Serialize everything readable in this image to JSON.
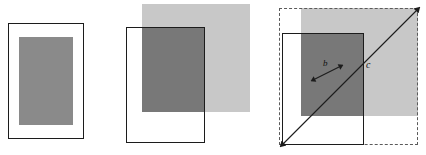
{
  "figure": {
    "title": "",
    "background_color": "#ffffff",
    "panel_count": 3
  },
  "colors": {
    "outline": "#1c1c1c",
    "mid_gray": "#8a8a8a",
    "light_gray": "#c8c8c8",
    "dark_overlap_gray": "#787878",
    "dashed_border": "#5a5a5a",
    "arrow": "#1c1c1c",
    "label_text": "#111111",
    "background": "#ffffff"
  },
  "panels": [
    {
      "id": "panel-a",
      "name": "panel-left",
      "shapes": [
        {
          "name": "outer-rectangle-a",
          "kind": "rect-outline",
          "x": 8,
          "y": 23,
          "width": 76,
          "height": 116
        },
        {
          "name": "inner-gray-rectangle-a",
          "kind": "rect-fill-mid",
          "x": 19,
          "y": 37,
          "width": 54,
          "height": 88
        }
      ],
      "labels": []
    },
    {
      "id": "panel-b",
      "name": "panel-middle",
      "shapes": [
        {
          "name": "light-gray-square-b",
          "kind": "rect-fill-light",
          "x": 22,
          "y": 4,
          "width": 108,
          "height": 108
        },
        {
          "name": "outer-rectangle-b",
          "kind": "rect-outline",
          "x": 6,
          "y": 27,
          "width": 79,
          "height": 116
        },
        {
          "name": "overlap-dark-region-b",
          "kind": "rect-fill-dark",
          "x": 22,
          "y": 27,
          "width": 63,
          "height": 85
        }
      ],
      "labels": []
    },
    {
      "id": "panel-c",
      "name": "panel-right",
      "shapes": [
        {
          "name": "dashed-bounding-box-c",
          "kind": "rect-dashed",
          "x": 19,
          "y": 8,
          "width": 139,
          "height": 137
        },
        {
          "name": "light-gray-square-c",
          "kind": "rect-fill-light",
          "x": 41,
          "y": 8,
          "width": 117,
          "height": 108
        },
        {
          "name": "outer-rectangle-c",
          "kind": "rect-outline",
          "x": 22,
          "y": 33,
          "width": 82,
          "height": 112
        },
        {
          "name": "overlap-dark-region-c",
          "kind": "rect-fill-dark",
          "x": 41,
          "y": 33,
          "width": 63,
          "height": 83
        }
      ],
      "arrows": [
        {
          "name": "diagonal-arrow-c",
          "label": "c",
          "double_headed": true,
          "x1": 22,
          "y1": 145,
          "x2": 158,
          "y2": 9
        },
        {
          "name": "short-arrow-b",
          "label": "b",
          "double_headed": true,
          "x1": 54,
          "y1": 79,
          "x2": 80,
          "y2": 66
        }
      ],
      "labels": [
        {
          "name": "label-b",
          "text": "b",
          "x": 63,
          "y": 59,
          "font_size": 9
        },
        {
          "name": "label-c",
          "text": "c",
          "x": 106,
          "y": 60,
          "font_size": 10
        }
      ]
    }
  ]
}
